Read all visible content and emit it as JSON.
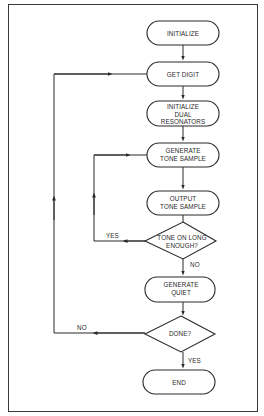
{
  "diagram": {
    "type": "flowchart",
    "nodes": [
      {
        "id": "initialize",
        "shape": "terminal",
        "lines": [
          "INITIALIZE"
        ]
      },
      {
        "id": "get_digit",
        "shape": "terminal",
        "lines": [
          "GET DIGIT"
        ]
      },
      {
        "id": "init_resonators",
        "shape": "terminal",
        "lines": [
          "INITIALIZE",
          "DUAL",
          "RESONATORS"
        ]
      },
      {
        "id": "gen_tone",
        "shape": "terminal",
        "lines": [
          "GENERATE",
          "TONE SAMPLE"
        ]
      },
      {
        "id": "output_tone",
        "shape": "terminal",
        "lines": [
          "OUTPUT",
          "TONE SAMPLE"
        ]
      },
      {
        "id": "tone_long",
        "shape": "decision",
        "lines": [
          "TONE ON LONG",
          "ENOUGH?"
        ]
      },
      {
        "id": "gen_quiet",
        "shape": "terminal",
        "lines": [
          "GENERATE",
          "QUIET"
        ]
      },
      {
        "id": "done",
        "shape": "decision",
        "lines": [
          "DONE?"
        ]
      },
      {
        "id": "end",
        "shape": "terminal",
        "lines": [
          "END"
        ]
      }
    ],
    "edges": [
      {
        "from": "initialize",
        "to": "get_digit",
        "label": ""
      },
      {
        "from": "get_digit",
        "to": "init_resonators",
        "label": ""
      },
      {
        "from": "init_resonators",
        "to": "gen_tone",
        "label": ""
      },
      {
        "from": "gen_tone",
        "to": "output_tone",
        "label": ""
      },
      {
        "from": "output_tone",
        "to": "tone_long",
        "label": ""
      },
      {
        "from": "tone_long",
        "to": "gen_tone",
        "label": "YES"
      },
      {
        "from": "tone_long",
        "to": "gen_quiet",
        "label": "NO"
      },
      {
        "from": "gen_quiet",
        "to": "done",
        "label": ""
      },
      {
        "from": "done",
        "to": "get_digit",
        "label": "NO"
      },
      {
        "from": "done",
        "to": "end",
        "label": "YES"
      }
    ],
    "edge_labels": {
      "tone_yes": "YES",
      "tone_no": "NO",
      "done_no": "NO",
      "done_yes": "YES"
    },
    "colors": {
      "line": "#2a2a2a",
      "background": "#ffffff",
      "border": "#3a3a3a"
    }
  }
}
